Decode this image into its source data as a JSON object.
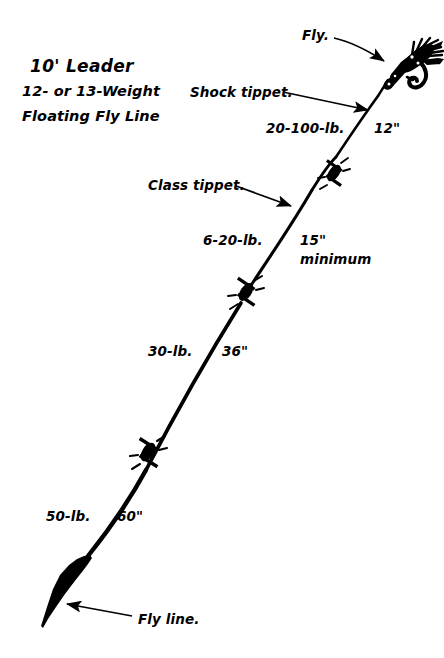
{
  "title": {
    "line1": "10' Leader",
    "line2": "12- or 13-Weight",
    "line3": "Floating Fly Line"
  },
  "callouts": {
    "fly": "Fly.",
    "shock_tippet": "Shock tippet.",
    "class_tippet": "Class tippet.",
    "fly_line": "Fly line."
  },
  "segments": {
    "shock_strength": "20-100-lb.",
    "shock_length": "12\"",
    "class_strength": "6-20-lb.",
    "class_length": "15\"",
    "class_length_note": "minimum",
    "butt_mid_strength": "30-lb.",
    "butt_mid_length": "36\"",
    "butt_strength": "50-lb.",
    "butt_length": "60\""
  },
  "colors": {
    "ink": "#000000",
    "background": "#ffffff"
  }
}
